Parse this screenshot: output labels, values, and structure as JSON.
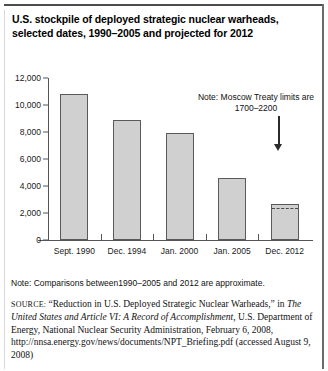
{
  "figure": {
    "title": "U.S. stockpile of deployed strategic nuclear warheads, selected dates, 1990–2005 and projected for 2012",
    "note": "Note: Comparisons between1990–2005 and 2012 are approximate.",
    "source_label": "SOURCE:",
    "source_part1": "“Reduction in U.S. Deployed Strategic Nuclear Warheads,” in",
    "source_italic": "The United States and Article VI: A Record of Accomplishment,",
    "source_part2": "U.S. Department of Energy, National Nuclear Security Administration, February 6, 2008, http://nnsa.energy.gov/news/documents/NPT_Briefing.pdf (accessed August 9, 2008)"
  },
  "chart_data": {
    "type": "bar",
    "title": "U.S. stockpile of deployed strategic nuclear warheads, selected dates, 1990–2005 and projected for 2012",
    "categories": [
      "Sept. 1990",
      "Dec. 1994",
      "Jan. 2000",
      "Jan. 2005",
      "Dec. 2012"
    ],
    "values": [
      10800,
      8900,
      7950,
      4600,
      2700
    ],
    "xlabel": "",
    "ylabel": "",
    "ylim": [
      0,
      12000
    ],
    "yticks": [
      0,
      2000,
      4000,
      6000,
      8000,
      10000,
      12000
    ],
    "ytick_labels": [
      "0",
      "2,000",
      "4,000",
      "6,000",
      "8,000",
      "10,000",
      "12,000"
    ],
    "grid": false,
    "legend": "none",
    "annotations": [
      {
        "text": "Note: Moscow Treaty limits are 1700–2200",
        "target_category": "Dec. 2012",
        "reference_line_value": 2200
      }
    ],
    "bar_fill": "#d0d0d0",
    "bar_edge": "#5a5a5a"
  }
}
